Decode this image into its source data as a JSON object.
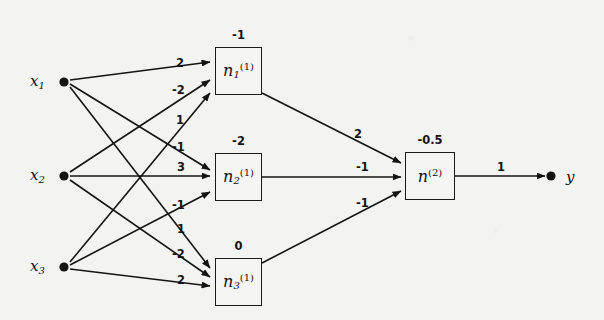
{
  "figure": {
    "type": "neural-network-diagram",
    "background_color": "#f3f3f1",
    "ink_color": "#141414"
  },
  "inputs": [
    {
      "id": "x1",
      "label": "x",
      "subscript": "1",
      "cx": 64,
      "cy": 82
    },
    {
      "id": "x2",
      "label": "x",
      "subscript": "2",
      "cx": 64,
      "cy": 176
    },
    {
      "id": "x3",
      "label": "x",
      "subscript": "3",
      "cx": 64,
      "cy": 267
    }
  ],
  "hidden_layer": [
    {
      "id": "n1",
      "name": "n",
      "subscript": "1",
      "superscript": "(1)",
      "bias": "-1",
      "x": 215,
      "y": 47,
      "w": 47,
      "h": 48
    },
    {
      "id": "n2",
      "name": "n",
      "subscript": "2",
      "superscript": "(1)",
      "bias": "-2",
      "x": 215,
      "y": 153,
      "w": 47,
      "h": 48
    },
    {
      "id": "n3",
      "name": "n",
      "subscript": "3",
      "superscript": "(1)",
      "bias": "0",
      "x": 215,
      "y": 258,
      "w": 47,
      "h": 48
    }
  ],
  "output_layer": [
    {
      "id": "n2out",
      "name": "n",
      "subscript": "",
      "superscript": "(2)",
      "bias": "-0.5",
      "x": 405,
      "y": 152,
      "w": 50,
      "h": 48
    }
  ],
  "output": {
    "id": "y",
    "label": "y",
    "cx": 551,
    "cy": 176,
    "label_x": 566,
    "label_y": 168
  },
  "weights": {
    "input_to_hidden": [
      {
        "from": "x1",
        "to": "n1",
        "value": "2",
        "lx": 176,
        "ly": 56
      },
      {
        "from": "x2",
        "to": "n1",
        "value": "-2",
        "lx": 172,
        "ly": 83
      },
      {
        "from": "x3",
        "to": "n1",
        "value": "1",
        "lx": 176,
        "ly": 113
      },
      {
        "from": "x1",
        "to": "n2",
        "value": "-1",
        "lx": 172,
        "ly": 140
      },
      {
        "from": "x2",
        "to": "n2",
        "value": "3",
        "lx": 177,
        "ly": 160
      },
      {
        "from": "x3",
        "to": "n2",
        "value": "-1",
        "lx": 172,
        "ly": 198
      },
      {
        "from": "x1",
        "to": "n3",
        "value": "1",
        "lx": 177,
        "ly": 222
      },
      {
        "from": "x2",
        "to": "n3",
        "value": "-2",
        "lx": 172,
        "ly": 247
      },
      {
        "from": "x3",
        "to": "n3",
        "value": "2",
        "lx": 177,
        "ly": 273
      }
    ],
    "hidden_to_output": [
      {
        "from": "n1",
        "to": "n2out",
        "value": "2",
        "lx": 354,
        "ly": 127
      },
      {
        "from": "n2",
        "to": "n2out",
        "value": "-1",
        "lx": 356,
        "ly": 160
      },
      {
        "from": "n3",
        "to": "n2out",
        "value": "-1",
        "lx": 356,
        "ly": 196
      }
    ],
    "output_edge": {
      "from": "n2out",
      "to": "y",
      "value": "1",
      "lx": 497,
      "ly": 160
    }
  },
  "edges": [
    {
      "name": "x1-to-n1",
      "x1": 70,
      "y1": 80,
      "x2": 210,
      "y2": 62
    },
    {
      "name": "x1-to-n2",
      "x1": 70,
      "y1": 84,
      "x2": 210,
      "y2": 170
    },
    {
      "name": "x1-to-n3",
      "x1": 70,
      "y1": 87,
      "x2": 210,
      "y2": 268
    },
    {
      "name": "x2-to-n1",
      "x1": 70,
      "y1": 172,
      "x2": 210,
      "y2": 80
    },
    {
      "name": "x2-to-n2",
      "x1": 70,
      "y1": 176,
      "x2": 210,
      "y2": 176
    },
    {
      "name": "x2-to-n3",
      "x1": 70,
      "y1": 180,
      "x2": 210,
      "y2": 277
    },
    {
      "name": "x3-to-n1",
      "x1": 70,
      "y1": 262,
      "x2": 210,
      "y2": 93
    },
    {
      "name": "x3-to-n2",
      "x1": 70,
      "y1": 265,
      "x2": 210,
      "y2": 192
    },
    {
      "name": "x3-to-n3",
      "x1": 70,
      "y1": 269,
      "x2": 210,
      "y2": 286
    },
    {
      "name": "n1-to-out",
      "x1": 262,
      "y1": 93,
      "x2": 401,
      "y2": 163
    },
    {
      "name": "n2-to-out",
      "x1": 262,
      "y1": 177,
      "x2": 401,
      "y2": 177
    },
    {
      "name": "n3-to-out",
      "x1": 262,
      "y1": 263,
      "x2": 401,
      "y2": 191
    },
    {
      "name": "out-to-y",
      "x1": 455,
      "y1": 176,
      "x2": 545,
      "y2": 176
    }
  ]
}
